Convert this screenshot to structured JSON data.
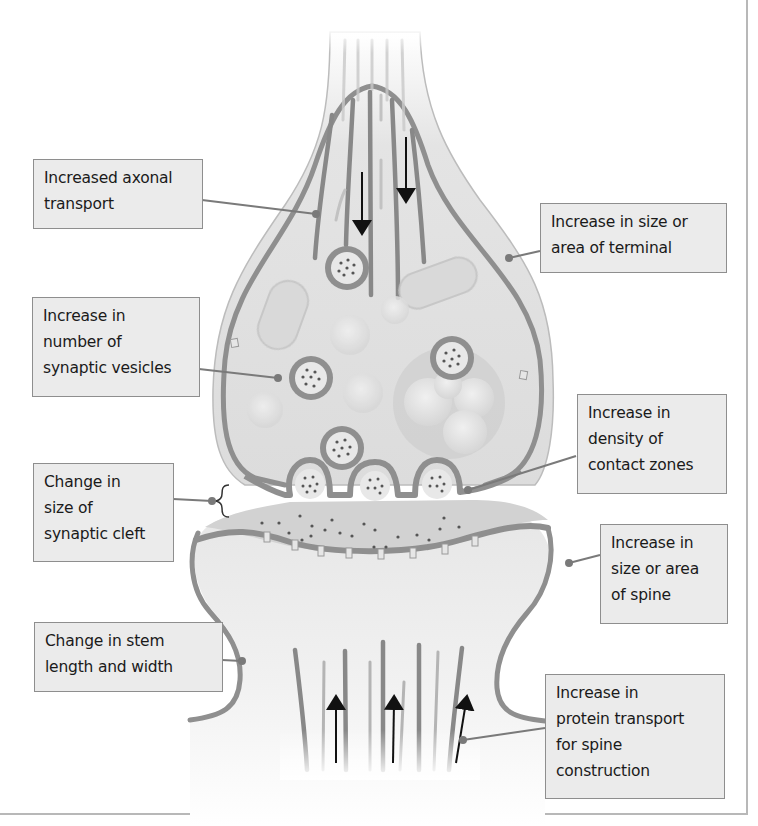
{
  "diagram": {
    "colors": {
      "membrane": "#8f8f8f",
      "cytoplasm": "#dcdcdc",
      "label_bg": "#ebebeb",
      "label_border": "#8e8e8e",
      "leader": "#7a7a7a",
      "arrow": "#111111",
      "frame": "#b8b8b8"
    },
    "labels": [
      {
        "id": "axonal-transport",
        "text": "Increased axonal\ntransport"
      },
      {
        "id": "terminal-size",
        "text": "Increase in size or\narea of terminal"
      },
      {
        "id": "synaptic-vesicles",
        "text": "Increase in\nnumber of\nsynaptic vesicles"
      },
      {
        "id": "contact-zones",
        "text": "Increase in\ndensity of\ncontact zones"
      },
      {
        "id": "synaptic-cleft",
        "text": "Change in\nsize of\nsynaptic cleft"
      },
      {
        "id": "spine-size",
        "text": "Increase in\nsize or area\nof spine"
      },
      {
        "id": "stem-length",
        "text": "Change in stem\nlength and width"
      },
      {
        "id": "protein-transport",
        "text": "Increase in\nprotein transport\nfor spine\nconstruction"
      }
    ],
    "structures": {
      "presynaptic_terminal": "Axon terminal (bouton) with microtubules, mitochondria, synaptic vesicles",
      "postsynaptic_spine": "Dendritic spine with receptor channels and microtubules",
      "arrows_down_count": 2,
      "arrows_up_count": 3,
      "vesicle_count": 7
    }
  }
}
